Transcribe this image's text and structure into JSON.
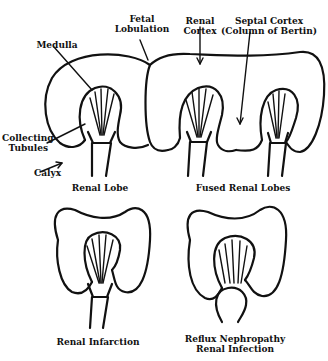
{
  "diagram": {
    "labels": {
      "fetal_lobulation": [
        "Fetal",
        "Lobulation"
      ],
      "renal_cortex": [
        "Renal",
        "Cortex"
      ],
      "septal_cortex": [
        "Septal Cortex",
        "(Column of Bertin)"
      ],
      "medulla": "Medulla",
      "collecting_tubules": [
        "Collecting",
        "Tubules"
      ],
      "calyx": "Calyx"
    },
    "panels": [
      {
        "caption": [
          "Renal Lobe"
        ]
      },
      {
        "caption": [
          "Fused Renal Lobes"
        ]
      },
      {
        "caption": [
          "Renal Infarction"
        ]
      },
      {
        "caption": [
          "Reflux Nephropathy",
          "Renal Infection"
        ]
      }
    ],
    "colors": {
      "stroke": "#111111",
      "background": "#ffffff"
    }
  }
}
